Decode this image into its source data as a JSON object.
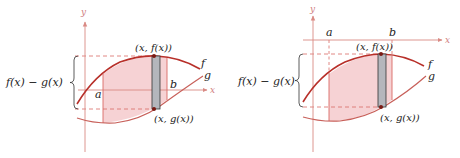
{
  "colors": {
    "curve_f": "#b8302a",
    "curve_g": "#c8605a",
    "axis": "#d98a84",
    "region_fill": "#f6d2d4",
    "strip_fill": "#b4b6bc",
    "strip_stroke": "#333333",
    "dashed": "#d96a64",
    "point": "#7a1a14"
  },
  "panels": [
    {
      "id": "left",
      "axis_labels": {
        "x": "x",
        "y": "y"
      },
      "bound_labels": {
        "a": "a",
        "b": "b"
      },
      "curve_labels": {
        "f": "f",
        "g": "g"
      },
      "point_labels": {
        "top": "(x, f(x))",
        "bottom": "(x, g(x))"
      },
      "brace_label": "f(x) − g(x)"
    },
    {
      "id": "right",
      "axis_labels": {
        "x": "x",
        "y": "y"
      },
      "bound_labels": {
        "a": "a",
        "b": "b"
      },
      "curve_labels": {
        "f": "f",
        "g": "g"
      },
      "point_labels": {
        "top": "(x, f(x))",
        "bottom": "(x, g(x))"
      },
      "brace_label": "f(x) − g(x)"
    }
  ]
}
